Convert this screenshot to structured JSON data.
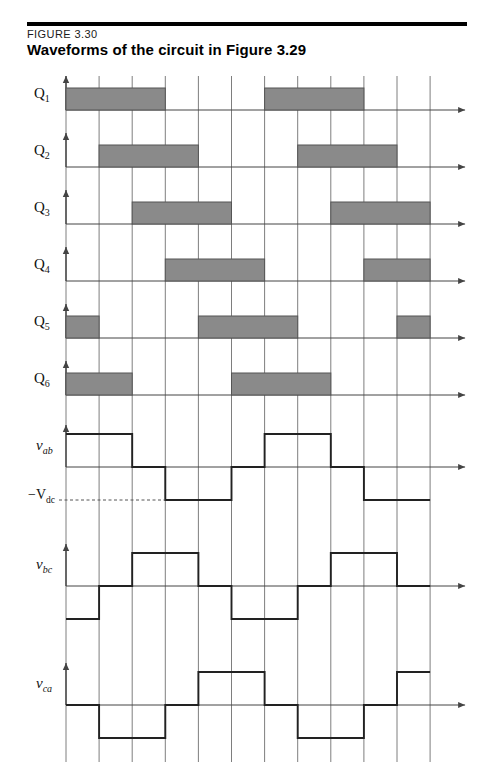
{
  "header": {
    "figure_number": "FIGURE 3.30",
    "title": "Waveforms of the circuit in Figure 3.29"
  },
  "labels": {
    "q1": "Q",
    "q1_sub": "1",
    "q2": "Q",
    "q2_sub": "2",
    "q3": "Q",
    "q3_sub": "3",
    "q4": "Q",
    "q4_sub": "4",
    "q5": "Q",
    "q5_sub": "5",
    "q6": "Q",
    "q6_sub": "6",
    "vab": "v",
    "vab_sub": "ab",
    "vbc": "v",
    "vbc_sub": "bc",
    "vca": "v",
    "vca_sub": "ca",
    "vdc_minus": "−V",
    "vdc_sub": "dc"
  },
  "colors": {
    "pulse_fill": "#8a8a8a",
    "pulse_stroke": "#555555",
    "grid": "#6f6f6f",
    "axis": "#444444",
    "waveform": "#222222",
    "rule": "#000000"
  },
  "chart_data": {
    "type": "line",
    "title": "Waveforms of the circuit in Figure 3.29",
    "xlabel": "",
    "ylabel": "",
    "grid": true,
    "legend_position": "left-labels",
    "x_interval_count": 11,
    "x_interval_degrees": 60,
    "gate_levels": [
      0,
      1
    ],
    "voltage_levels": [
      -1,
      0,
      1
    ],
    "series": [
      {
        "name": "Q1",
        "kind": "gate",
        "on_intervals": [
          [
            0,
            3
          ],
          [
            6,
            9
          ],
          [
            11,
            11.5
          ]
        ],
        "values": [
          1,
          1,
          1,
          0,
          0,
          0,
          1,
          1,
          1,
          0,
          0,
          1
        ]
      },
      {
        "name": "Q2",
        "kind": "gate",
        "on_intervals": [
          [
            1,
            4
          ],
          [
            7,
            10
          ]
        ],
        "values": [
          0,
          1,
          1,
          1,
          0,
          0,
          0,
          1,
          1,
          1,
          0,
          0
        ]
      },
      {
        "name": "Q3",
        "kind": "gate",
        "on_intervals": [
          [
            2,
            5
          ],
          [
            8,
            11
          ]
        ],
        "values": [
          0,
          0,
          1,
          1,
          1,
          0,
          0,
          0,
          1,
          1,
          1,
          0
        ]
      },
      {
        "name": "Q4",
        "kind": "gate",
        "on_intervals": [
          [
            3,
            6
          ],
          [
            9,
            11.5
          ]
        ],
        "values": [
          0,
          0,
          0,
          1,
          1,
          1,
          0,
          0,
          0,
          1,
          1,
          1
        ]
      },
      {
        "name": "Q5",
        "kind": "gate",
        "on_intervals": [
          [
            0,
            1
          ],
          [
            4,
            7
          ],
          [
            10,
            11.5
          ]
        ],
        "values": [
          1,
          0,
          0,
          0,
          1,
          1,
          1,
          0,
          0,
          0,
          1,
          1
        ]
      },
      {
        "name": "Q6",
        "kind": "gate",
        "on_intervals": [
          [
            0,
            2
          ],
          [
            5,
            8
          ],
          [
            11,
            11.5
          ]
        ],
        "values": [
          1,
          1,
          0,
          0,
          0,
          1,
          1,
          1,
          0,
          0,
          0,
          1
        ]
      },
      {
        "name": "vab",
        "kind": "voltage",
        "values": [
          1,
          1,
          0,
          -1,
          -1,
          0,
          1,
          1,
          0,
          -1,
          -1,
          0
        ]
      },
      {
        "name": "vbc",
        "kind": "voltage",
        "values": [
          -1,
          0,
          1,
          1,
          0,
          -1,
          -1,
          0,
          1,
          1,
          0,
          -1
        ]
      },
      {
        "name": "vca",
        "kind": "voltage",
        "values": [
          0,
          -1,
          -1,
          0,
          1,
          1,
          0,
          -1,
          -1,
          0,
          1,
          1
        ]
      }
    ],
    "annotations": [
      {
        "text": "−Vdc",
        "axis": "y",
        "series": "vab",
        "value": -1,
        "style": "dashed-leader"
      }
    ]
  }
}
